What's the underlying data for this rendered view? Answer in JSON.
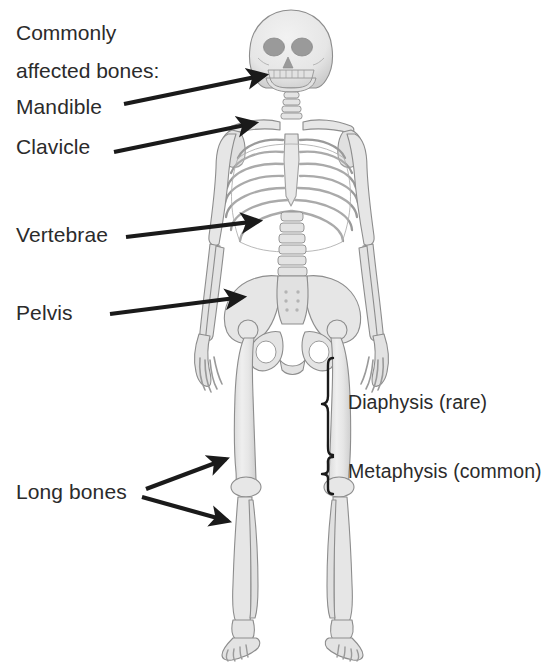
{
  "figure": {
    "type": "anatomical-diagram",
    "background_color": "#ffffff",
    "bone_fill_color": "#e9e9e9",
    "bone_outline_color": "#8d8d8d",
    "bone_shadow_color": "#b9b9b9",
    "socket_color": "#9a9a9a",
    "annotation_color": "#1a1a1a",
    "text_color": "#2b2b2b"
  },
  "title": {
    "line1": "Commonly",
    "line2": "affected bones:"
  },
  "labels": [
    {
      "id": "mandible",
      "text": "Mandible",
      "x": 16,
      "y": 96,
      "target": "skull-jaw"
    },
    {
      "id": "clavicle",
      "text": "Clavicle",
      "x": 16,
      "y": 136,
      "target": "clavicle-bone"
    },
    {
      "id": "vertebrae",
      "text": "Vertebrae",
      "x": 16,
      "y": 224,
      "target": "lumbar-spine"
    },
    {
      "id": "pelvis",
      "text": "Pelvis",
      "x": 16,
      "y": 302,
      "target": "pelvis-bone"
    },
    {
      "id": "long-bones",
      "text": "Long bones",
      "x": 16,
      "y": 481,
      "target": "femur-and-tibia"
    },
    {
      "id": "diaphysis",
      "text": "Diaphysis (rare)",
      "x": 348,
      "y": 392,
      "target": "femur-shaft"
    },
    {
      "id": "metaphysis",
      "text": "Metaphysis (common)",
      "x": 348,
      "y": 461,
      "target": "femur-distal-end"
    }
  ],
  "arrows": [
    {
      "id": "arrow-mandible",
      "from": [
        124,
        104
      ],
      "to": [
        268,
        74
      ],
      "label": "Mandible"
    },
    {
      "id": "arrow-clavicle",
      "from": [
        114,
        152
      ],
      "to": [
        258,
        122
      ],
      "label": "Clavicle"
    },
    {
      "id": "arrow-vertebrae",
      "from": [
        126,
        237
      ],
      "to": [
        262,
        221
      ],
      "label": "Vertebrae"
    },
    {
      "id": "arrow-pelvis",
      "from": [
        110,
        314
      ],
      "to": [
        246,
        296
      ],
      "label": "Pelvis"
    },
    {
      "id": "arrow-long-bones-up",
      "from": [
        146,
        489
      ],
      "to": [
        229,
        457
      ],
      "label": "Long bones (femur)"
    },
    {
      "id": "arrow-long-bones-down",
      "from": [
        142,
        497
      ],
      "to": [
        231,
        523
      ],
      "label": "Long bones (tibia)"
    }
  ],
  "braces": [
    {
      "id": "brace-diaphysis",
      "x": 330,
      "y_top": 358,
      "y_bottom": 455,
      "label": "Diaphysis (rare)"
    },
    {
      "id": "brace-metaphysis",
      "x": 330,
      "y_top": 457,
      "y_bottom": 494,
      "label": "Metaphysis (common)"
    }
  ],
  "skeleton_parts": [
    "skull",
    "mandible",
    "cervical-spine",
    "clavicle-left",
    "clavicle-right",
    "scapula-left",
    "scapula-right",
    "sternum",
    "ribcage",
    "lumbar-spine",
    "humerus-left",
    "humerus-right",
    "radius-ulna-left",
    "radius-ulna-right",
    "hand-left",
    "hand-right",
    "pelvis",
    "sacrum",
    "femur-left",
    "femur-right",
    "patella-left",
    "patella-right",
    "tibia-fibula-left",
    "tibia-fibula-right",
    "foot-left",
    "foot-right"
  ]
}
